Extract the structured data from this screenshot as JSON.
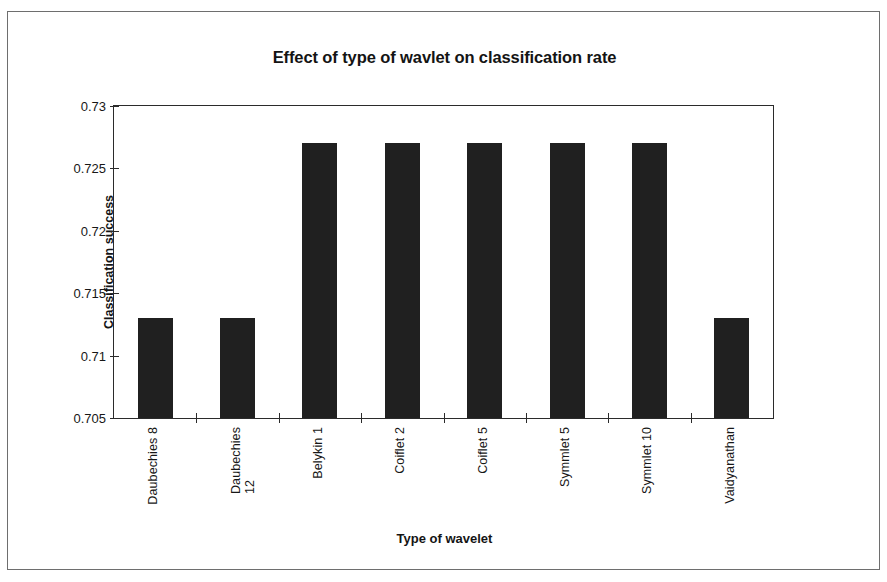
{
  "chart_data": {
    "type": "bar",
    "title": "Effect of type of wavlet on classification rate",
    "xlabel": "Type of wavelet",
    "ylabel": "Classification success",
    "categories": [
      "Daubechies 8",
      "Daubechies 12",
      "Belykin 1",
      "Coiflet 2",
      "Coiflet 5",
      "Symmlet 5",
      "Symmlet 10",
      "Vaidyanathan"
    ],
    "values": [
      0.713,
      0.713,
      0.727,
      0.727,
      0.727,
      0.727,
      0.727,
      0.713
    ],
    "ylim": [
      0.705,
      0.73
    ],
    "ytick_labels": [
      "0.73",
      "0.725",
      "0.72",
      "0.715",
      "0.71",
      "0.705"
    ],
    "ytick_values": [
      0.73,
      0.725,
      0.72,
      0.715,
      0.71,
      0.705
    ],
    "grid": false,
    "legend": false,
    "bar_color": "#202020",
    "axis_color": "#2b2b2b",
    "background_color": "#ffffff"
  }
}
